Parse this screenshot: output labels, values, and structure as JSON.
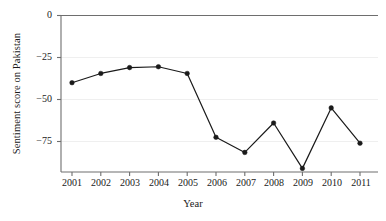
{
  "chart_data": {
    "type": "line",
    "title": "",
    "xlabel": "Year",
    "ylabel": "Sentiment score on Pakistan",
    "categories": [
      "2001",
      "2002",
      "2003",
      "2004",
      "2005",
      "2006",
      "2007",
      "2008",
      "2009",
      "2010",
      "2011"
    ],
    "values": [
      -40,
      -34.5,
      -31,
      -30.5,
      -34.5,
      -72.5,
      -81.5,
      -64,
      -91,
      -55,
      -76
    ],
    "series": [
      {
        "name": "Sentiment score on Pakistan",
        "values": [
          -40,
          -34.5,
          -31,
          -30.5,
          -34.5,
          -72.5,
          -81.5,
          -64,
          -91,
          -55,
          -76
        ]
      }
    ],
    "x": [
      2001,
      2002,
      2003,
      2004,
      2005,
      2006,
      2007,
      2008,
      2009,
      2010,
      2011
    ],
    "ylim": [
      -97,
      0
    ],
    "xlim": [
      2000.6,
      2011.4
    ],
    "yticks": [
      0,
      -25,
      -50,
      -75
    ],
    "ytick_labels": [
      "0",
      "−25",
      "−50",
      "−75"
    ],
    "xticks": [
      2001,
      2002,
      2003,
      2004,
      2005,
      2006,
      2007,
      2008,
      2009,
      2010,
      2011
    ],
    "grid": "horizontal-faint",
    "legend": "none",
    "line_color": "#1a1a1a",
    "marker": "filled-circle",
    "marker_color": "#1a1a1a",
    "axis_color": "#6e6e6e",
    "grid_color": "#efefef",
    "background": "#ffffff"
  }
}
